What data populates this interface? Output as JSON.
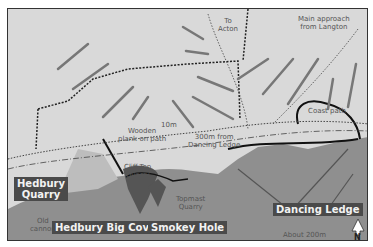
{
  "map": {
    "places": {
      "hedbury_quarry": "Hedbury\nQuarry",
      "hedbury_big_cove": "Hedbury Big Cove",
      "smokey_hole": "Smokey Hole",
      "dancing_ledge": "Dancing Ledge"
    },
    "annotations": {
      "to_acton": "To\nActon",
      "main_approach": "Main approach\nfrom Langton",
      "coast_path": "Coast path",
      "wooden_plank": "Wooden\nplank on path",
      "ten_m": "10m",
      "three_hundred_m": "300m from\nDancing Ledge",
      "cliff_top_quarry": "Cliff-Top\nQuarry",
      "topmast_quarry": "Topmast\nQuarry",
      "old_cannon": "Old\ncannon"
    },
    "scale_bar": "About 200m",
    "north_label": "N",
    "colors": {
      "land": "#d9d9d9",
      "sea": "#8f8f8f",
      "label_bg": "#4a4a4a",
      "frame": "#333333"
    }
  }
}
